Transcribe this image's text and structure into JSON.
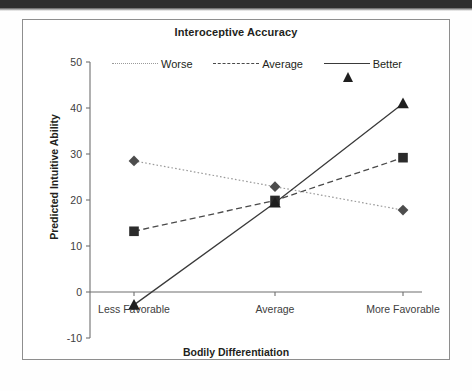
{
  "figure": {
    "title": "Interoceptive Accuracy",
    "xlabel": "Bodily Differentiation",
    "ylabel": "Predicted Intuitive Ability"
  },
  "legend": {
    "items": [
      {
        "label": "Worse",
        "marker": "diamond-marker",
        "line": "dotted"
      },
      {
        "label": "Average",
        "marker": "square-marker",
        "line": "dashed"
      },
      {
        "label": "Better",
        "marker": "triangle-marker",
        "line": "solid"
      }
    ]
  },
  "axes": {
    "y_ticks": [
      "50",
      "40",
      "30",
      "20",
      "10",
      "0",
      "-10"
    ],
    "x_ticks": [
      "Less Favorable",
      "Average",
      "More Favorable"
    ]
  },
  "chart_data": {
    "type": "line",
    "title": "Interoceptive Accuracy",
    "xlabel": "Bodily Differentiation",
    "ylabel": "Predicted Intuitive Ability",
    "categories": [
      "Less Favorable",
      "Average",
      "More Favorable"
    ],
    "series": [
      {
        "name": "Worse",
        "values": [
          28.5,
          22.9,
          17.8
        ],
        "marker": "diamond",
        "linestyle": "dotted"
      },
      {
        "name": "Average",
        "values": [
          13.2,
          19.9,
          29.2
        ],
        "marker": "square",
        "linestyle": "dashed"
      },
      {
        "name": "Better",
        "values": [
          -2.8,
          19.4,
          41.0
        ],
        "marker": "triangle",
        "linestyle": "solid"
      }
    ],
    "ylim": [
      -10,
      50
    ],
    "ytick_values": [
      50,
      40,
      30,
      20,
      10,
      0,
      -10
    ],
    "grid": false,
    "legend_position": "top"
  },
  "colors": {
    "worse": "#9a9a9a",
    "average": "#4a4a4a",
    "better": "#3a3a3a",
    "axis": "#6f6f6f",
    "text": "#231f20"
  }
}
